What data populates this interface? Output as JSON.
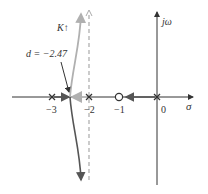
{
  "diagram": {
    "type": "root-locus",
    "axes": {
      "real_axis_label": "σ",
      "imag_axis_label": "jω"
    },
    "ticks": [
      {
        "value": "−3",
        "x": 52
      },
      {
        "value": "−2",
        "x": 89
      },
      {
        "value": "−1",
        "x": 119
      },
      {
        "value": "0",
        "x": 160
      }
    ],
    "poles": [
      {
        "value": -3,
        "x": 52
      },
      {
        "value": -2,
        "x": 89
      },
      {
        "value": 0,
        "x": 157
      }
    ],
    "zeros": [
      {
        "value": -1,
        "x": 119
      }
    ],
    "asymptote": {
      "value": -2,
      "style": "dashed"
    },
    "annotations": {
      "gain_label": "K",
      "gain_arrow": "↑",
      "breakaway_label": "d = −2.47"
    },
    "colors": {
      "axis": "#333333",
      "locus_dark": "#555555",
      "locus_light": "#b0b0b0",
      "asymptote": "#aaaaaa"
    }
  }
}
